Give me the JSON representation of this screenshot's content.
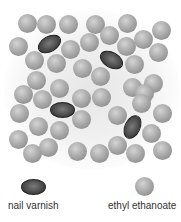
{
  "diagram": {
    "colors": {
      "ethyl_ethanoate": "#a8a8a8",
      "nail_varnish": "#4a4a4a",
      "background_glow": "#e6e6e6",
      "label_text": "#333333"
    },
    "sphere_radius": 9.5,
    "ethyl_ethanoate_particles": [
      [
        27,
        23
      ],
      [
        46,
        24
      ],
      [
        68,
        24
      ],
      [
        95,
        24
      ],
      [
        127,
        23
      ],
      [
        161,
        30
      ],
      [
        18,
        46
      ],
      [
        109,
        35
      ],
      [
        143,
        39
      ],
      [
        89,
        42
      ],
      [
        126,
        46
      ],
      [
        158,
        52
      ],
      [
        34,
        60
      ],
      [
        56,
        63
      ],
      [
        70,
        49
      ],
      [
        82,
        68
      ],
      [
        100,
        76
      ],
      [
        134,
        64
      ],
      [
        36,
        80
      ],
      [
        59,
        88
      ],
      [
        23,
        94
      ],
      [
        132,
        87
      ],
      [
        153,
        83
      ],
      [
        42,
        99
      ],
      [
        81,
        98
      ],
      [
        101,
        97
      ],
      [
        144,
        93
      ],
      [
        19,
        113
      ],
      [
        38,
        126
      ],
      [
        59,
        130
      ],
      [
        81,
        119
      ],
      [
        117,
        115
      ],
      [
        141,
        103
      ],
      [
        162,
        113
      ],
      [
        18,
        139
      ],
      [
        32,
        153
      ],
      [
        48,
        147
      ],
      [
        77,
        151
      ],
      [
        99,
        153
      ],
      [
        117,
        145
      ],
      [
        135,
        153
      ],
      [
        151,
        133
      ],
      [
        162,
        150
      ]
    ],
    "nail_varnish_particles": [
      {
        "x": 49,
        "y": 44,
        "rotate": -30
      },
      {
        "x": 111,
        "y": 60,
        "rotate": 30
      },
      {
        "x": 62,
        "y": 110,
        "rotate": 0
      },
      {
        "x": 132,
        "y": 127,
        "rotate": -65
      }
    ]
  },
  "legend": {
    "items": [
      {
        "label": "nail varnish",
        "symbol": "dark-oval",
        "x": 33,
        "y": 187
      },
      {
        "label": "ethyl ethanoate",
        "symbol": "grey-sphere",
        "x": 144,
        "y": 186
      }
    ]
  }
}
